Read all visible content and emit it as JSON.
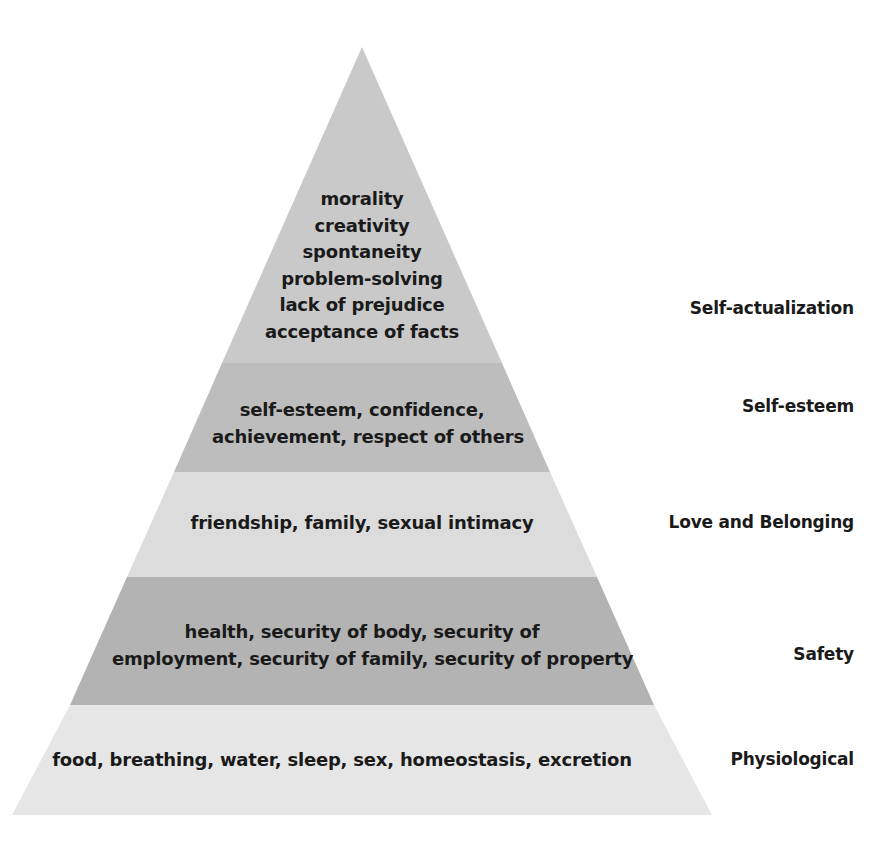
{
  "diagram": {
    "type": "pyramid",
    "levels": [
      {
        "name": "Self-actualization",
        "items": [
          "morality",
          "creativity",
          "spontaneity",
          "problem-solving",
          "lack of prejudice",
          "acceptance of facts"
        ],
        "color": "#c9c9c9"
      },
      {
        "name": "Self-esteem",
        "items": [
          "self-esteem, confidence,",
          "achievement, respect of others"
        ],
        "color": "#bdbdbd"
      },
      {
        "name": "Love and Belonging",
        "items": [
          "friendship, family, sexual intimacy"
        ],
        "color": "#dcdcdc"
      },
      {
        "name": "Safety",
        "items": [
          "health, security of body, security of",
          "employment, security of family, security of property"
        ],
        "color": "#b3b3b3"
      },
      {
        "name": "Physiological",
        "items": [
          "food, breathing, water, sleep, sex, homeostasis, excretion"
        ],
        "color": "#e6e6e6"
      }
    ]
  }
}
